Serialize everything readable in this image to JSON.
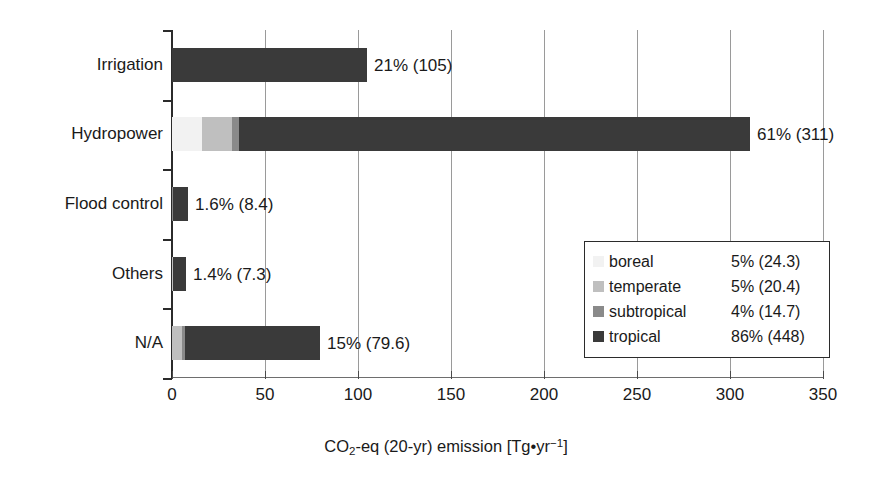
{
  "chart_data": {
    "type": "bar",
    "orientation": "horizontal",
    "stacked": true,
    "title": "",
    "xlabel": "CO2-eq (20-yr) emission [Tg•yr-1]",
    "ylabel": "",
    "xlim": [
      0,
      350
    ],
    "xticks": [
      0,
      50,
      100,
      150,
      200,
      250,
      300,
      350
    ],
    "xtick_labels": [
      "0",
      "50",
      "100",
      "150",
      "200",
      "250",
      "300",
      "350"
    ],
    "grid": "vertical",
    "legend_position": "inside-lower-right",
    "categories": [
      "Irrigation",
      "Hydropower",
      "Flood control",
      "Others",
      "N/A"
    ],
    "series": [
      {
        "name": "boreal",
        "color": "#f2f2f2",
        "values": [
          0,
          16.0,
          0,
          0,
          0
        ]
      },
      {
        "name": "temperate",
        "color": "#bfbfbf",
        "values": [
          0,
          16.5,
          0,
          0.4,
          5.2
        ]
      },
      {
        "name": "subtropical",
        "color": "#8a8a8a",
        "values": [
          0,
          3.5,
          0.3,
          0.3,
          1.8
        ]
      },
      {
        "name": "tropical",
        "color": "#3a3a3a",
        "values": [
          105,
          275,
          8.1,
          6.6,
          72.6
        ]
      }
    ],
    "bar_totals": [
      105,
      311,
      8.4,
      7.3,
      79.6
    ],
    "bar_labels": [
      "21% (105)",
      "61% (311)",
      "1.6% (8.4)",
      "1.4% (7.3)",
      "15% (79.6)"
    ],
    "legend_entries": [
      {
        "name": "boreal",
        "value": "5% (24.3)",
        "pct": 5,
        "amount": 24.3,
        "color": "#f2f2f2"
      },
      {
        "name": "temperate",
        "value": "5% (20.4)",
        "pct": 5,
        "amount": 20.4,
        "color": "#bfbfbf"
      },
      {
        "name": "subtropical",
        "value": "4% (14.7)",
        "pct": 4,
        "amount": 14.7,
        "color": "#8a8a8a"
      },
      {
        "name": "tropical",
        "value": "86% (448)",
        "pct": 86,
        "amount": 448,
        "color": "#3a3a3a"
      }
    ]
  },
  "axis": {
    "x_title_main": "CO",
    "x_title_sub": "2",
    "x_title_rest": "-eq (20-yr) emission [Tg•yr",
    "x_title_sup": "−1",
    "x_title_end": "]"
  }
}
